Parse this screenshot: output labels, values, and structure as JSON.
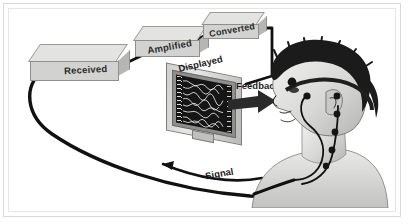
{
  "figure": {
    "background_color": "#ffffff",
    "frame_color": "#d9d9d9",
    "style": "grayscale medical illustration"
  },
  "stages": [
    {
      "id": "received",
      "label": "Received",
      "order": 1
    },
    {
      "id": "amplified",
      "label": "Amplified",
      "order": 2
    },
    {
      "id": "converted",
      "label": "Converted",
      "order": 3
    }
  ],
  "display": {
    "label": "Displayed",
    "device": "monitor",
    "screen_color": "#151515",
    "trace_color": "#f0f0f0",
    "trace_count": 8
  },
  "arrows": [
    {
      "id": "feedback",
      "label": "Feedback",
      "direction": "right",
      "from": "display",
      "to": "subject"
    },
    {
      "id": "signal",
      "label": "Signal",
      "direction": "left",
      "from": "subject",
      "to": "display"
    }
  ],
  "subject": {
    "description": "Man in profile wearing electrode headband",
    "electrode_count": 6,
    "headband": true
  },
  "cables": {
    "color": "#111111",
    "paths": [
      "subject-to-received",
      "received-to-amplified",
      "amplified-to-converted",
      "converted-to-display"
    ]
  }
}
